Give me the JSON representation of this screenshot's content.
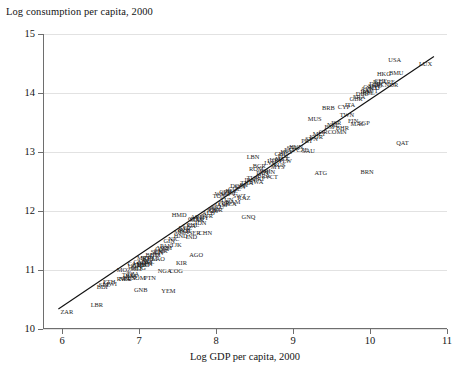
{
  "chart_data": {
    "type": "scatter",
    "title": "",
    "ylabel": "Log consumption per capita, 2000",
    "xlabel": "Log GDP per capita, 2000",
    "xlim": [
      5.75,
      11.0
    ],
    "ylim": [
      10.0,
      15.0
    ],
    "xticks": [
      "6",
      "7",
      "8",
      "9",
      "10",
      "11"
    ],
    "xtick_values": [
      6,
      7,
      8,
      9,
      10,
      11
    ],
    "yticks": [
      "10",
      "11",
      "12",
      "13",
      "14",
      "15"
    ],
    "ytick_values": [
      10,
      11,
      12,
      13,
      14,
      15
    ],
    "grid": "horizontal",
    "legend": "none",
    "marker_style": "text-labels",
    "fit_line": {
      "label": "linear fit",
      "x": [
        5.95,
        10.83
      ],
      "y": [
        10.34,
        14.62
      ]
    },
    "points": [
      {
        "label": "ZAR",
        "x": 6.06,
        "y": 10.28
      },
      {
        "label": "LBR",
        "x": 6.45,
        "y": 10.4
      },
      {
        "label": "GNB",
        "x": 7.02,
        "y": 10.66
      },
      {
        "label": "YEM",
        "x": 7.38,
        "y": 10.64
      },
      {
        "label": "BDI",
        "x": 6.52,
        "y": 10.72
      },
      {
        "label": "ETH",
        "x": 6.61,
        "y": 10.79
      },
      {
        "label": "SLE",
        "x": 6.55,
        "y": 10.74
      },
      {
        "label": "MWI",
        "x": 6.62,
        "y": 10.76
      },
      {
        "label": "NER",
        "x": 6.82,
        "y": 10.85
      },
      {
        "label": "TCD",
        "x": 6.86,
        "y": 10.92
      },
      {
        "label": "SOM",
        "x": 6.99,
        "y": 10.86
      },
      {
        "label": "BEN",
        "x": 6.87,
        "y": 10.87
      },
      {
        "label": "RWA",
        "x": 6.8,
        "y": 10.84
      },
      {
        "label": "TZA",
        "x": 6.92,
        "y": 10.94
      },
      {
        "label": "BFA",
        "x": 6.9,
        "y": 10.9
      },
      {
        "label": "PTN",
        "x": 7.14,
        "y": 10.87
      },
      {
        "label": "NGA",
        "x": 7.33,
        "y": 10.98
      },
      {
        "label": "COG",
        "x": 7.48,
        "y": 10.99
      },
      {
        "label": "MLI",
        "x": 6.96,
        "y": 11.02
      },
      {
        "label": "MOZ",
        "x": 6.8,
        "y": 11.0
      },
      {
        "label": "UGA",
        "x": 6.94,
        "y": 11.06
      },
      {
        "label": "KEN",
        "x": 7.09,
        "y": 11.1
      },
      {
        "label": "NPL",
        "x": 7.12,
        "y": 11.14
      },
      {
        "label": "MDG",
        "x": 6.99,
        "y": 11.03
      },
      {
        "label": "ZMB",
        "x": 7.0,
        "y": 11.08
      },
      {
        "label": "TGO",
        "x": 7.05,
        "y": 11.08
      },
      {
        "label": "COM",
        "x": 7.07,
        "y": 11.12
      },
      {
        "label": "GMB",
        "x": 7.02,
        "y": 11.13
      },
      {
        "label": "KHM",
        "x": 7.14,
        "y": 11.18
      },
      {
        "label": "LAO",
        "x": 7.25,
        "y": 11.18
      },
      {
        "label": "MRT",
        "x": 7.06,
        "y": 11.21
      },
      {
        "label": "SDN",
        "x": 7.1,
        "y": 11.2
      },
      {
        "label": "CAF",
        "x": 6.93,
        "y": 11.1
      },
      {
        "label": "KIR",
        "x": 7.55,
        "y": 11.12
      },
      {
        "label": "BGD",
        "x": 7.17,
        "y": 11.26
      },
      {
        "label": "HTI",
        "x": 7.21,
        "y": 11.25
      },
      {
        "label": "SEN",
        "x": 7.23,
        "y": 11.3
      },
      {
        "label": "CIV",
        "x": 7.26,
        "y": 11.28
      },
      {
        "label": "CMR",
        "x": 7.28,
        "y": 11.33
      },
      {
        "label": "GHA",
        "x": 7.3,
        "y": 11.36
      },
      {
        "label": "PAK",
        "x": 7.35,
        "y": 11.4
      },
      {
        "label": "VNM",
        "x": 7.33,
        "y": 11.38
      },
      {
        "label": "TJK",
        "x": 7.48,
        "y": 11.42
      },
      {
        "label": "AGO",
        "x": 7.74,
        "y": 11.25
      },
      {
        "label": "GIN",
        "x": 7.39,
        "y": 11.5
      },
      {
        "label": "NIC",
        "x": 7.45,
        "y": 11.52
      },
      {
        "label": "HND",
        "x": 7.54,
        "y": 11.58
      },
      {
        "label": "IND",
        "x": 7.68,
        "y": 11.56
      },
      {
        "label": "SER",
        "x": 7.72,
        "y": 11.62
      },
      {
        "label": "BOL",
        "x": 7.6,
        "y": 11.66
      },
      {
        "label": "MDA",
        "x": 7.55,
        "y": 11.64
      },
      {
        "label": "UZB",
        "x": 7.58,
        "y": 11.68
      },
      {
        "label": "LKA",
        "x": 7.65,
        "y": 11.74
      },
      {
        "label": "PHL",
        "x": 7.7,
        "y": 11.76
      },
      {
        "label": "IDN",
        "x": 7.8,
        "y": 11.8
      },
      {
        "label": "CHN",
        "x": 7.86,
        "y": 11.62
      },
      {
        "label": "MAR",
        "x": 7.75,
        "y": 11.84
      },
      {
        "label": "EGY",
        "x": 7.82,
        "y": 11.88
      },
      {
        "label": "SYR",
        "x": 7.88,
        "y": 11.92
      },
      {
        "label": "GEO",
        "x": 7.72,
        "y": 11.86
      },
      {
        "label": "ARM",
        "x": 7.76,
        "y": 11.9
      },
      {
        "label": "KGZ",
        "x": 7.6,
        "y": 11.72
      },
      {
        "label": "HMD",
        "x": 7.52,
        "y": 11.94
      },
      {
        "label": "ALB",
        "x": 7.9,
        "y": 11.96
      },
      {
        "label": "JOR",
        "x": 7.95,
        "y": 12.0
      },
      {
        "label": "GNQ",
        "x": 8.42,
        "y": 11.9
      },
      {
        "label": "PRY",
        "x": 7.98,
        "y": 12.04
      },
      {
        "label": "ECU",
        "x": 8.02,
        "y": 12.06
      },
      {
        "label": "JAM",
        "x": 8.06,
        "y": 12.1
      },
      {
        "label": "PER",
        "x": 8.1,
        "y": 12.14
      },
      {
        "label": "TUN",
        "x": 8.14,
        "y": 12.18
      },
      {
        "label": "NAM",
        "x": 8.22,
        "y": 12.16
      },
      {
        "label": "DZA",
        "x": 8.18,
        "y": 12.12
      },
      {
        "label": "SWZ",
        "x": 8.3,
        "y": 12.26
      },
      {
        "label": "KAZ",
        "x": 8.36,
        "y": 12.22
      },
      {
        "label": "UKR",
        "x": 8.0,
        "y": 12.02
      },
      {
        "label": "TON",
        "x": 8.04,
        "y": 12.26
      },
      {
        "label": "WSM",
        "x": 8.08,
        "y": 12.28
      },
      {
        "label": "CPV",
        "x": 8.12,
        "y": 12.32
      },
      {
        "label": "GTM",
        "x": 8.16,
        "y": 12.3
      },
      {
        "label": "BLZ",
        "x": 8.2,
        "y": 12.34
      },
      {
        "label": "COL",
        "x": 8.24,
        "y": 12.38
      },
      {
        "label": "DOM",
        "x": 8.28,
        "y": 12.42
      },
      {
        "label": "SLV",
        "x": 8.32,
        "y": 12.4
      },
      {
        "label": "FJI",
        "x": 8.36,
        "y": 12.44
      },
      {
        "label": "THA",
        "x": 8.4,
        "y": 12.48
      },
      {
        "label": "IRN",
        "x": 8.44,
        "y": 12.52
      },
      {
        "label": "TUR",
        "x": 8.48,
        "y": 12.56
      },
      {
        "label": "BWA",
        "x": 8.52,
        "y": 12.5
      },
      {
        "label": "BRA",
        "x": 8.62,
        "y": 12.6
      },
      {
        "label": "VCT",
        "x": 8.72,
        "y": 12.58
      },
      {
        "label": "ZAF",
        "x": 8.56,
        "y": 12.54
      },
      {
        "label": "PAN",
        "x": 8.6,
        "y": 12.64
      },
      {
        "label": "CRI",
        "x": 8.64,
        "y": 12.68
      },
      {
        "label": "VEN",
        "x": 8.68,
        "y": 12.66
      },
      {
        "label": "LBN",
        "x": 8.48,
        "y": 12.92
      },
      {
        "label": "ROM",
        "x": 8.52,
        "y": 12.72
      },
      {
        "label": "BGR",
        "x": 8.56,
        "y": 12.76
      },
      {
        "label": "RUS",
        "x": 8.82,
        "y": 12.78
      },
      {
        "label": "LVA",
        "x": 8.7,
        "y": 12.82
      },
      {
        "label": "LTU",
        "x": 8.74,
        "y": 12.84
      },
      {
        "label": "MEX",
        "x": 8.86,
        "y": 12.88
      },
      {
        "label": "PLW",
        "x": 8.9,
        "y": 12.84
      },
      {
        "label": "MYS",
        "x": 8.8,
        "y": 12.74
      },
      {
        "label": "URY",
        "x": 8.78,
        "y": 12.86
      },
      {
        "label": "CHL",
        "x": 8.84,
        "y": 12.96
      },
      {
        "label": "POL",
        "x": 8.88,
        "y": 12.94
      },
      {
        "label": "HRV",
        "x": 8.92,
        "y": 13.0
      },
      {
        "label": "EST",
        "x": 8.96,
        "y": 13.04
      },
      {
        "label": "SVK",
        "x": 9.0,
        "y": 13.06
      },
      {
        "label": "HUN",
        "x": 9.04,
        "y": 13.08
      },
      {
        "label": "CZE",
        "x": 9.12,
        "y": 13.04
      },
      {
        "label": "SAU",
        "x": 9.2,
        "y": 13.02
      },
      {
        "label": "ATG",
        "x": 9.36,
        "y": 12.64
      },
      {
        "label": "BRN",
        "x": 9.96,
        "y": 12.66
      },
      {
        "label": "PRT",
        "x": 9.18,
        "y": 13.18
      },
      {
        "label": "SVN",
        "x": 9.24,
        "y": 13.22
      },
      {
        "label": "KOR",
        "x": 9.3,
        "y": 13.26
      },
      {
        "label": "MLT",
        "x": 9.34,
        "y": 13.3
      },
      {
        "label": "GRC",
        "x": 9.42,
        "y": 13.34
      },
      {
        "label": "ESP",
        "x": 9.48,
        "y": 13.42
      },
      {
        "label": "NZL",
        "x": 9.52,
        "y": 13.46
      },
      {
        "label": "ISR",
        "x": 9.56,
        "y": 13.5
      },
      {
        "label": "MUS",
        "x": 9.28,
        "y": 13.56
      },
      {
        "label": "BRB",
        "x": 9.46,
        "y": 13.74
      },
      {
        "label": "CYP",
        "x": 9.66,
        "y": 13.76
      },
      {
        "label": "MAC",
        "x": 9.84,
        "y": 13.48
      },
      {
        "label": "OMN",
        "x": 9.6,
        "y": 13.34
      },
      {
        "label": "BHR",
        "x": 9.64,
        "y": 13.4
      },
      {
        "label": "TWN",
        "x": 9.7,
        "y": 13.62
      },
      {
        "label": "ITA",
        "x": 9.74,
        "y": 13.8
      },
      {
        "label": "GBR",
        "x": 9.82,
        "y": 13.9
      },
      {
        "label": "FIN",
        "x": 9.78,
        "y": 13.52
      },
      {
        "label": "SGP",
        "x": 9.92,
        "y": 13.5
      },
      {
        "label": "FRA",
        "x": 9.86,
        "y": 13.94
      },
      {
        "label": "DEU",
        "x": 9.9,
        "y": 13.98
      },
      {
        "label": "JPN",
        "x": 9.94,
        "y": 14.02
      },
      {
        "label": "AUS",
        "x": 9.96,
        "y": 14.06
      },
      {
        "label": "CAN",
        "x": 10.0,
        "y": 14.1
      },
      {
        "label": "BEL",
        "x": 9.98,
        "y": 14.0
      },
      {
        "label": "AUT",
        "x": 10.02,
        "y": 14.04
      },
      {
        "label": "NLD",
        "x": 10.04,
        "y": 14.08
      },
      {
        "label": "SWE",
        "x": 10.06,
        "y": 14.12
      },
      {
        "label": "DNK",
        "x": 10.08,
        "y": 14.16
      },
      {
        "label": "ISL",
        "x": 10.1,
        "y": 14.18
      },
      {
        "label": "IRL",
        "x": 10.12,
        "y": 14.14
      },
      {
        "label": "CHE",
        "x": 10.14,
        "y": 14.2
      },
      {
        "label": "ARE",
        "x": 10.24,
        "y": 14.18
      },
      {
        "label": "NOR",
        "x": 10.28,
        "y": 14.14
      },
      {
        "label": "HKG",
        "x": 10.18,
        "y": 14.32
      },
      {
        "label": "BMU",
        "x": 10.34,
        "y": 14.34
      },
      {
        "label": "QAT",
        "x": 10.42,
        "y": 13.16
      },
      {
        "label": "USA",
        "x": 10.32,
        "y": 14.56
      },
      {
        "label": "LUX",
        "x": 10.72,
        "y": 14.5
      }
    ]
  }
}
